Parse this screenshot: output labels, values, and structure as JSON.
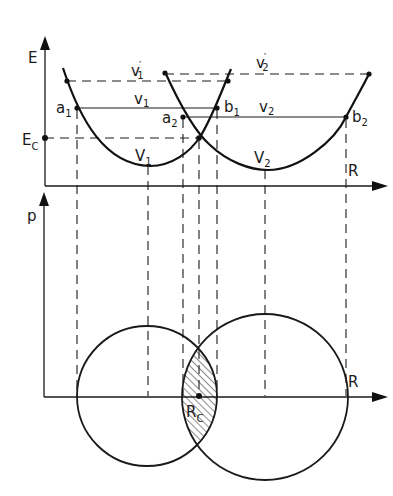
{
  "figure": {
    "top_panel": {
      "y_axis_label": "E",
      "x_axis_label": "R",
      "ec_label": "E",
      "ec_sub": "C",
      "curve1_label": "V",
      "curve1_sub": "1",
      "curve2_label": "V",
      "curve2_sub": "2",
      "level_v1_label": "v",
      "level_v1_sub": "1",
      "level_v1p_label": "v",
      "level_v1p_sub": "1",
      "level_v1p_prime": "′",
      "level_v2_label": "v",
      "level_v2_sub": "2",
      "level_v2p_label": "v",
      "level_v2p_sub": "2",
      "level_v2p_prime": "′",
      "point_a1": "a",
      "point_a1_sub": "1",
      "point_a2": "a",
      "point_a2_sub": "2",
      "point_b1": "b",
      "point_b1_sub": "1",
      "point_b2": "b",
      "point_b2_sub": "2"
    },
    "bottom_panel": {
      "y_axis_label": "p",
      "x_axis_label": "R",
      "rc_label": "R",
      "rc_sub": "C"
    }
  }
}
